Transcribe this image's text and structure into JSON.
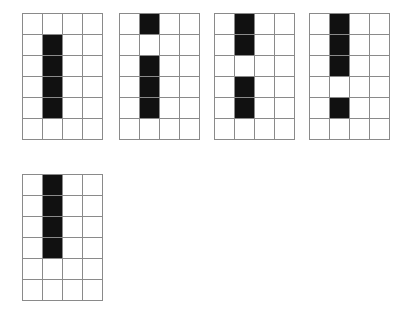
{
  "figure": {
    "canvas": {
      "width": 406,
      "height": 311
    },
    "background_color": "#ffffff",
    "grid_line_color": "#8a8a8a",
    "filled_cell_color": "#111111",
    "empty_cell_color": "#ffffff",
    "cell_width": 20,
    "cell_height": 21,
    "rows": 6,
    "columns": 4,
    "grids": [
      {
        "name": "grid-1",
        "label": "1",
        "x": 22,
        "y": 13,
        "rows": 6,
        "columns": 4,
        "filled_column": 1,
        "filled_rows": [
          1,
          2,
          3,
          4
        ],
        "cells": [
          [
            0,
            0,
            0,
            0
          ],
          [
            0,
            1,
            0,
            0
          ],
          [
            0,
            1,
            0,
            0
          ],
          [
            0,
            1,
            0,
            0
          ],
          [
            0,
            1,
            0,
            0
          ],
          [
            0,
            0,
            0,
            0
          ]
        ]
      },
      {
        "name": "grid-2",
        "label": "2",
        "x": 119,
        "y": 13,
        "rows": 6,
        "columns": 4,
        "filled_column": 1,
        "filled_rows": [
          0,
          2,
          3,
          4
        ],
        "cells": [
          [
            0,
            1,
            0,
            0
          ],
          [
            0,
            0,
            0,
            0
          ],
          [
            0,
            1,
            0,
            0
          ],
          [
            0,
            1,
            0,
            0
          ],
          [
            0,
            1,
            0,
            0
          ],
          [
            0,
            0,
            0,
            0
          ]
        ]
      },
      {
        "name": "grid-3",
        "label": "3",
        "x": 214,
        "y": 13,
        "rows": 6,
        "columns": 4,
        "filled_column": 1,
        "filled_rows": [
          0,
          1,
          3,
          4
        ],
        "cells": [
          [
            0,
            1,
            0,
            0
          ],
          [
            0,
            1,
            0,
            0
          ],
          [
            0,
            0,
            0,
            0
          ],
          [
            0,
            1,
            0,
            0
          ],
          [
            0,
            1,
            0,
            0
          ],
          [
            0,
            0,
            0,
            0
          ]
        ]
      },
      {
        "name": "grid-4",
        "label": "4",
        "x": 309,
        "y": 13,
        "rows": 6,
        "columns": 4,
        "filled_column": 1,
        "filled_rows": [
          0,
          1,
          2,
          4
        ],
        "cells": [
          [
            0,
            1,
            0,
            0
          ],
          [
            0,
            1,
            0,
            0
          ],
          [
            0,
            1,
            0,
            0
          ],
          [
            0,
            0,
            0,
            0
          ],
          [
            0,
            1,
            0,
            0
          ],
          [
            0,
            0,
            0,
            0
          ]
        ]
      },
      {
        "name": "grid-5",
        "label": "5",
        "x": 22,
        "y": 174,
        "rows": 6,
        "columns": 4,
        "filled_column": 1,
        "filled_rows": [
          0,
          1,
          2,
          3
        ],
        "cells": [
          [
            0,
            1,
            0,
            0
          ],
          [
            0,
            1,
            0,
            0
          ],
          [
            0,
            1,
            0,
            0
          ],
          [
            0,
            1,
            0,
            0
          ],
          [
            0,
            0,
            0,
            0
          ],
          [
            0,
            0,
            0,
            0
          ]
        ]
      }
    ]
  }
}
